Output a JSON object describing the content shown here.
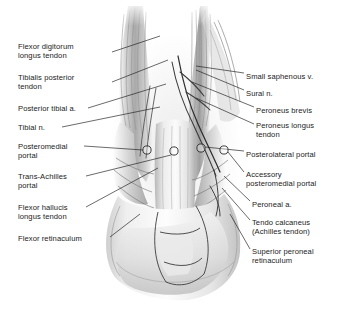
{
  "figure": {
    "view": "posterior",
    "background_color": "#ffffff",
    "ink_color": "#1b1b1b"
  },
  "labels_left": [
    {
      "id": "flexor-digitorum-longus-tendon",
      "lines": "Flexor digitorum\nlongus tendon",
      "x": 18,
      "y": 42
    },
    {
      "id": "tibialis-posterior-tendon",
      "lines": "Tibialis posterior\ntendon",
      "x": 18,
      "y": 73
    },
    {
      "id": "posterior-tibial-artery",
      "lines": "Posterior tibial a.",
      "x": 18,
      "y": 104
    },
    {
      "id": "tibial-nerve",
      "lines": "Tibial n.",
      "x": 18,
      "y": 123
    },
    {
      "id": "posteromedial-portal",
      "lines": "Posteromedial\nportal",
      "x": 18,
      "y": 142
    },
    {
      "id": "trans-achilles-portal",
      "lines": "Trans-Achilles\nportal",
      "x": 18,
      "y": 172
    },
    {
      "id": "flexor-hallucis-longus-tendon",
      "lines": "Flexor hallucis\nlongus tendon",
      "x": 18,
      "y": 203
    },
    {
      "id": "flexor-retinaculum",
      "lines": "Flexor retinaculum",
      "x": 18,
      "y": 234
    }
  ],
  "labels_right": [
    {
      "id": "small-saphenous-vein",
      "lines": "Small saphenous v.",
      "x": 246,
      "y": 72
    },
    {
      "id": "sural-nerve",
      "lines": "Sural n.",
      "x": 246,
      "y": 89
    },
    {
      "id": "peroneus-brevis",
      "lines": "Peroneus brevis",
      "x": 256,
      "y": 106
    },
    {
      "id": "peroneus-longus-tendon",
      "lines": "Peroneus longus\ntendon",
      "x": 256,
      "y": 121
    },
    {
      "id": "posterolateral-portal",
      "lines": "Posterolateral portal",
      "x": 246,
      "y": 150
    },
    {
      "id": "accessory-posteromedial-portal",
      "lines": "Accessory\nposteromedial portal",
      "x": 246,
      "y": 170
    },
    {
      "id": "peroneal-artery",
      "lines": "Peroneal a.",
      "x": 252,
      "y": 200
    },
    {
      "id": "tendo-calcaneus",
      "lines": "Tendo calcaneus\n(Achilles tendon)",
      "x": 252,
      "y": 218
    },
    {
      "id": "superior-peroneal-retinaculum",
      "lines": "Superior peroneal\nretinaculum",
      "x": 252,
      "y": 247
    }
  ],
  "portals": [
    {
      "id": "posteromedial-portal-marker",
      "cx": 147,
      "cy": 150
    },
    {
      "id": "trans-achilles-portal-marker",
      "cx": 174,
      "cy": 151
    },
    {
      "id": "posterolateral-portal-marker",
      "cx": 201,
      "cy": 148
    },
    {
      "id": "accessory-posteromedial-portal-marker",
      "cx": 224,
      "cy": 150
    }
  ],
  "leaders_left": [
    {
      "id": "leader-flexor-digitorum-longus",
      "x1": 112,
      "y1": 52,
      "x2": 160,
      "y2": 36
    },
    {
      "id": "leader-tibialis-posterior",
      "x1": 112,
      "y1": 82,
      "x2": 168,
      "y2": 60
    },
    {
      "id": "leader-posterior-tibial-artery",
      "x1": 88,
      "y1": 108,
      "x2": 166,
      "y2": 84
    },
    {
      "id": "leader-tibial-nerve",
      "x1": 62,
      "y1": 127,
      "x2": 160,
      "y2": 107
    },
    {
      "id": "leader-posteromedial-portal",
      "x1": 84,
      "y1": 146,
      "x2": 143,
      "y2": 150
    },
    {
      "id": "leader-trans-achilles-portal",
      "x1": 86,
      "y1": 176,
      "x2": 171,
      "y2": 155
    },
    {
      "id": "leader-flexor-hallucis-longus",
      "x1": 86,
      "y1": 207,
      "x2": 158,
      "y2": 168
    },
    {
      "id": "leader-flexor-retinaculum",
      "x1": 110,
      "y1": 237,
      "x2": 140,
      "y2": 214
    }
  ],
  "leaders_right": [
    {
      "id": "leader-small-saphenous-vein",
      "x1": 244,
      "y1": 73,
      "x2": 196,
      "y2": 66
    },
    {
      "id": "leader-sural-nerve",
      "x1": 244,
      "y1": 90,
      "x2": 196,
      "y2": 70
    },
    {
      "id": "leader-peroneus-brevis",
      "x1": 254,
      "y1": 107,
      "x2": 192,
      "y2": 82
    },
    {
      "id": "leader-peroneus-longus",
      "x1": 254,
      "y1": 124,
      "x2": 196,
      "y2": 98
    },
    {
      "id": "leader-posterolateral-portal",
      "x1": 244,
      "y1": 151,
      "x2": 205,
      "y2": 147
    },
    {
      "id": "leader-accessory-posteromedial",
      "x1": 244,
      "y1": 172,
      "x2": 228,
      "y2": 152
    },
    {
      "id": "leader-peroneal-artery",
      "x1": 250,
      "y1": 201,
      "x2": 224,
      "y2": 176
    },
    {
      "id": "leader-tendo-calcaneus",
      "x1": 250,
      "y1": 220,
      "x2": 222,
      "y2": 188
    },
    {
      "id": "leader-superior-peroneal-retinaculum",
      "x1": 250,
      "y1": 249,
      "x2": 230,
      "y2": 214
    }
  ]
}
